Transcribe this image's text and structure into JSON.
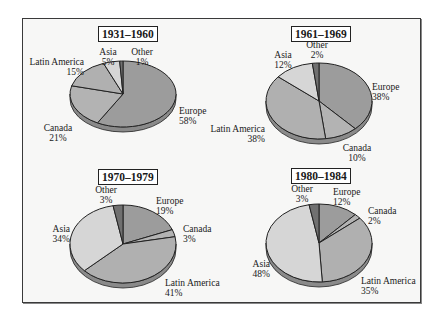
{
  "colors": {
    "Europe": "#9c9c9c",
    "Canada": "#b3b3b3",
    "Latin America": "#b0b0b0",
    "Asia": "#d6d6d6",
    "Other": "#707070",
    "edge": "#222222",
    "side": "#8a8a8a"
  },
  "chart_data": [
    {
      "type": "pie",
      "title": "1931–1960",
      "categories": [
        "Europe",
        "Canada",
        "Latin America",
        "Asia",
        "Other"
      ],
      "values": [
        58,
        21,
        15,
        5,
        1
      ],
      "labels": [
        "Europe 58%",
        "Canada 21%",
        "Latin America 15%",
        "Asia 5%",
        "Other 1%"
      ]
    },
    {
      "type": "pie",
      "title": "1961–1969",
      "categories": [
        "Europe",
        "Canada",
        "Latin America",
        "Asia",
        "Other"
      ],
      "values": [
        38,
        10,
        38,
        12,
        2
      ],
      "labels": [
        "Europe 38%",
        "Canada 10%",
        "Latin America 38%",
        "Asia 12%",
        "Other 2%"
      ]
    },
    {
      "type": "pie",
      "title": "1970–1979",
      "categories": [
        "Europe",
        "Canada",
        "Latin America",
        "Asia",
        "Other"
      ],
      "values": [
        19,
        3,
        41,
        34,
        3
      ],
      "labels": [
        "Europe 19%",
        "Canada 3%",
        "Latin America 41%",
        "Asia 34%",
        "Other 3%"
      ]
    },
    {
      "type": "pie",
      "title": "1980–1984",
      "categories": [
        "Europe",
        "Canada",
        "Latin America",
        "Asia",
        "Other"
      ],
      "values": [
        12,
        2,
        35,
        48,
        3
      ],
      "labels": [
        "Europe 12%",
        "Canada 2%",
        "Latin America 35%",
        "Asia 48%",
        "Other 3%"
      ]
    }
  ],
  "panels": [
    {
      "title": "1931–1960",
      "labels": {
        "Europe": {
          "name": "Europe",
          "pct": "58%"
        },
        "Canada": {
          "name": "Canada",
          "pct": "21%"
        },
        "Latin America": {
          "name": "Latin America",
          "pct": "15%"
        },
        "Asia": {
          "name": "Asia",
          "pct": "5%"
        },
        "Other": {
          "name": "Other",
          "pct": "1%"
        }
      }
    },
    {
      "title": "1961–1969",
      "labels": {
        "Europe": {
          "name": "Europe",
          "pct": "38%"
        },
        "Canada": {
          "name": "Canada",
          "pct": "10%"
        },
        "Latin America": {
          "name": "Latin America",
          "pct": "38%"
        },
        "Asia": {
          "name": "Asia",
          "pct": "12%"
        },
        "Other": {
          "name": "Other",
          "pct": "2%"
        }
      }
    },
    {
      "title": "1970–1979",
      "labels": {
        "Europe": {
          "name": "Europe",
          "pct": "19%"
        },
        "Canada": {
          "name": "Canada",
          "pct": "3%"
        },
        "Latin America": {
          "name": "Latin America",
          "pct": "41%"
        },
        "Asia": {
          "name": "Asia",
          "pct": "34%"
        },
        "Other": {
          "name": "Other",
          "pct": "3%"
        }
      }
    },
    {
      "title": "1980–1984",
      "labels": {
        "Europe": {
          "name": "Europe",
          "pct": "12%"
        },
        "Canada": {
          "name": "Canada",
          "pct": "2%"
        },
        "Latin America": {
          "name": "Latin America",
          "pct": "35%"
        },
        "Asia": {
          "name": "Asia",
          "pct": "48%"
        },
        "Other": {
          "name": "Other",
          "pct": "3%"
        }
      }
    }
  ]
}
